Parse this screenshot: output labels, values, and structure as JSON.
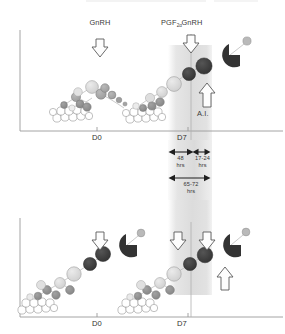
{
  "figure": {
    "type": "scientific-diagram",
    "panels": [
      {
        "id": "upper-panel",
        "axis": {
          "x_ticks": [
            "D0",
            "D7"
          ]
        },
        "treatment_labels": [
          {
            "text": "GnRH",
            "role": "first-gnrh"
          },
          {
            "text": "PGF",
            "subscript": "2α",
            "role": "prostaglandin"
          },
          {
            "text": "GnRH",
            "role": "second-gnrh"
          }
        ],
        "event_label": "A.I."
      },
      {
        "id": "lower-panel",
        "axis": {
          "x_ticks": [
            "D0",
            "D7"
          ]
        }
      }
    ],
    "intervals": [
      {
        "id": "interval-48",
        "value": "48",
        "unit": "hrs"
      },
      {
        "id": "interval-17-24",
        "value": "17-24",
        "unit": "hrs"
      },
      {
        "id": "interval-65-72",
        "value": "65-72",
        "unit": "hrs"
      }
    ],
    "colors": {
      "axis": "#8c8c8c",
      "dominant_follicle": "#3b3b3b",
      "corpus_luteum": "#333333",
      "growing_follicle": "#d6d6d6",
      "mid_follicle": "#a9a9a9",
      "small_follicle": "#8f8f8f",
      "primordial_follicle": "#ffffff",
      "band_shade": "#dcdcdc",
      "arrow_outline": "#555555",
      "text": "#333333"
    },
    "legend_keys": {
      "arrow_down": "treatment-administration-arrow",
      "arrow_up": "insemination-arrow",
      "pacman": "corpus-luteum-shape",
      "band": "synchronized-interval-band"
    }
  }
}
